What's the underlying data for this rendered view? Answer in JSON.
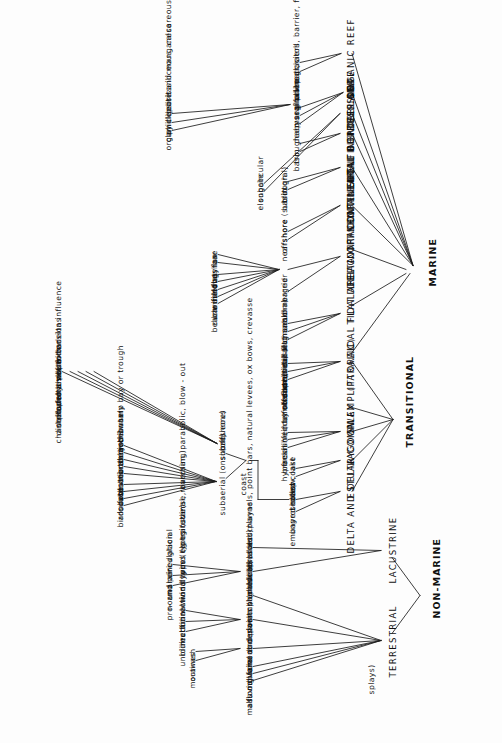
{
  "diagram": {
    "type": "hierarchy-tree",
    "orientation": "rotated-90ccw",
    "ink_color": "#111111",
    "background_color": "#fdfdfd"
  },
  "nodes": {
    "non_marine": "NON-MARINE",
    "marine": "MARINE",
    "transitional": "TRANSITIONAL",
    "terrestrial": "TERRESTRIAL",
    "lacustrine": "LACUSTRINE",
    "delta_and_delta_complex": "DELTA  AND  DELTA  COMPLEX",
    "estuary": "ESTUARY",
    "lagoon": "LAGOON",
    "swamp_paralic": "SWAMP (PARALIC)",
    "littoral": "LITTORAL",
    "tidal_flat_area": "TIDAL  FLAT  AREA",
    "tidal_delta_offshore_bar": "TIDAL DELTA OFFSHORE  BAR",
    "continental_shelf": "CONTINENTAL  SHELF",
    "deep_intracontinental_depression": "DEEP  INTRACONTINENTAL  DEPRESSION",
    "continental_borderland": "CONTINENTAL  BORDERLAND",
    "continental_slope": "CONTINENTAL  SLOPE",
    "deep_sea": "DEEP  SEA",
    "organic_reef": "ORGANIC  REEF",
    "coast": "coast",
    "subaerial_onshore": "subaerial (onshore)",
    "subaqueous_offshore_1": "subaqueous",
    "subaqueous_offshore_2": "(offshore)"
  },
  "terrestrial_children": [
    "mass  movement  deposits  (landslides, talus)",
    "alluvial  fans  and  plains",
    "floodplains  and  river  channels  (braided  channels,  point  bars,  natural  levees,  ox  bows,  crevasse",
    "splays)",
    "glacial",
    "dunes",
    "swamp  (paludal)"
  ],
  "glacial_children": [
    "moraines",
    "outwash"
  ],
  "dunes_children": [
    "unidirectional   wind   types  (eg transverse,  barchan, parabolic, blow - out",
    "bidirectional   wind   types   (longitudinal,  reversing)",
    "multidirectional  wind   types  (star)"
  ],
  "lacustrine_children": [
    "shallow lakes and playas",
    "deep lakes"
  ],
  "shallow_lakes_children": [
    "pro- and  peri - glacial",
    "normal   circulation",
    "undrained"
  ],
  "delta_children": [
    "embayed  coast , lake",
    "unprotected  coast"
  ],
  "coast_children": [
    "subaerial (onshore)",
    "subaqueous (offshore)"
  ],
  "subaerial_children": [
    "birds  foot",
    "arcuate",
    "lobate",
    "cuspate",
    "distributary  channel",
    "natural  levee",
    "marsh  and  swamp",
    "interdistributary  bay  or  trough",
    "beach ?"
  ],
  "subaqueous_children": [
    "channel  and  levee  extensions",
    "distributary  mouth  bar",
    "delta  front  platform",
    "prodelta  slope",
    "open shelf  with  delta  influence"
  ],
  "estuary_children": [
    "shallow",
    "deep"
  ],
  "lagoon_children": [
    "hypersaline (cut off from sea)",
    "brackish  (intermediate)",
    "fresh (fed  by  streams)"
  ],
  "swamp_paralic_children": [
    "(e.g sabkha)"
  ],
  "littoral_children": [
    "foreshore",
    "backshore",
    "supratidal   (e.g sabkha)"
  ],
  "tidal_flat_children": [
    "tidal flat",
    "tidal channel",
    "salt marsh"
  ],
  "tidal_delta_children": [
    "submerged",
    "barrier"
  ],
  "barrier_children": [
    "beach",
    "dune field",
    "barrier flat",
    "washover fan",
    "inlet",
    "longshore",
    "bay bar"
  ],
  "continental_shelf_children": [
    "nearshore (sublittoral)",
    "offshore"
  ],
  "deep_intracontinental_children": [
    "basin",
    "trough"
  ],
  "continental_borderland_children": [
    "basin",
    "trough"
  ],
  "continental_slope_children": [
    "elongate",
    "subcircular"
  ],
  "deep_sea_children": [
    "deep  sea fan",
    "abyssal  plain",
    "marginal  to  glaciers",
    "organic  debris  siliceous, calcareous",
    "clay  deposits",
    "phillipsite  and  manganese"
  ],
  "glaciers_node": "glaciers",
  "organic_reef_children": [
    "linear, atoll, barrier, fringing",
    "patch"
  ]
}
